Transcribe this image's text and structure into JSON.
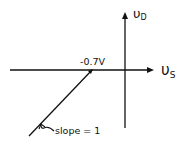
{
  "diagram": {
    "type": "transfer-characteristic",
    "axes": {
      "x_label_main": "υ",
      "x_label_sub": "S",
      "y_label_main": "υ",
      "y_label_sub": "D"
    },
    "annotations": {
      "breakpoint_label": "-0.7V",
      "slope_label": "slope = 1"
    },
    "stroke_color": "#111111",
    "background": "#ffffff"
  }
}
